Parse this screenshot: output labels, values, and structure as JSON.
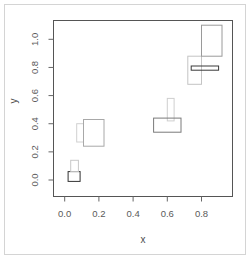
{
  "chart_data": {
    "type": "rect",
    "title": "",
    "xlabel": "x",
    "ylabel": "y",
    "xlim": [
      -0.07,
      0.98
    ],
    "ylim": [
      -0.12,
      1.13
    ],
    "xticks": [
      "0.0",
      "0.2",
      "0.4",
      "0.6",
      "0.8"
    ],
    "yticks": [
      "0.0",
      "0.2",
      "0.4",
      "0.6",
      "0.8",
      "1.0"
    ],
    "grid": false,
    "legend": null,
    "rectangles": [
      {
        "x0": 0.02,
        "x1": 0.09,
        "y0": -0.01,
        "y1": 0.06,
        "stroke": "#333333"
      },
      {
        "x0": 0.035,
        "x1": 0.08,
        "y0": 0.06,
        "y1": 0.14,
        "stroke": "#c8c8c8"
      },
      {
        "x0": 0.07,
        "x1": 0.11,
        "y0": 0.27,
        "y1": 0.4,
        "stroke": "#d0d0d0"
      },
      {
        "x0": 0.11,
        "x1": 0.23,
        "y0": 0.24,
        "y1": 0.43,
        "stroke": "#a8a8a8"
      },
      {
        "x0": 0.6,
        "x1": 0.64,
        "y0": 0.42,
        "y1": 0.58,
        "stroke": "#cfcfcf"
      },
      {
        "x0": 0.52,
        "x1": 0.68,
        "y0": 0.34,
        "y1": 0.44,
        "stroke": "#7a7a7a"
      },
      {
        "x0": 0.72,
        "x1": 0.8,
        "y0": 0.68,
        "y1": 0.88,
        "stroke": "#c4c4c4"
      },
      {
        "x0": 0.74,
        "x1": 0.9,
        "y0": 0.78,
        "y1": 0.81,
        "stroke": "#3a3a3a"
      },
      {
        "x0": 0.8,
        "x1": 0.92,
        "y0": 0.88,
        "y1": 1.1,
        "stroke": "#9a9a9a"
      }
    ]
  },
  "layout": {
    "plot_left": 53.5,
    "plot_top": 20.5,
    "plot_right": 232.5,
    "plot_bottom": 196.5,
    "x0_px": 64.7,
    "x_px_per_unit": 171.0,
    "y0_px": 180.0,
    "y_px_per_unit": 140.7
  }
}
